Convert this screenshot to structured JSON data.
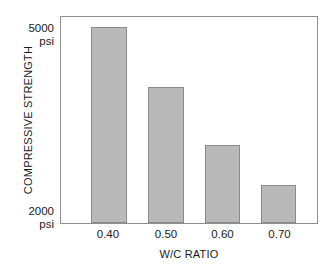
{
  "chart_data": {
    "type": "bar",
    "title": "",
    "xlabel": "W/C RATIO",
    "ylabel": "COMPRESSIVE STRENGTH",
    "categories": [
      "0.40",
      "0.50",
      "0.60",
      "0.70"
    ],
    "values": [
      5000,
      4100,
      3200,
      2600
    ],
    "value_unit": "psi",
    "ylim": [
      2000,
      5000
    ],
    "y_tick_labels": [
      "5000 psi",
      "2000 psi"
    ],
    "y_axis_top_value": "5000",
    "y_axis_top_unit": "psi",
    "y_axis_bottom_value": "2000",
    "y_axis_bottom_unit": "psi",
    "grid": false,
    "legend": false,
    "legend_position": "none",
    "bar_color": "#b9b9b9",
    "bar_edge_color": "#8a8a8a",
    "frame_color": "#8f8f8f",
    "background_color": "#ffffff",
    "bars": [
      {
        "category": "0.40",
        "value": 5000,
        "bar_left_pct": 11.6,
        "bar_width_pct": 14.0,
        "bar_height_pct": 95.2
      },
      {
        "category": "0.50",
        "value": 4100,
        "bar_left_pct": 34.1,
        "bar_width_pct": 14.0,
        "bar_height_pct": 65.9
      },
      {
        "category": "0.60",
        "value": 3200,
        "bar_left_pct": 56.2,
        "bar_width_pct": 13.6,
        "bar_height_pct": 38.0
      },
      {
        "category": "0.70",
        "value": 2600,
        "bar_left_pct": 78.3,
        "bar_width_pct": 13.6,
        "bar_height_pct": 18.3
      }
    ],
    "x_label_centers_pct": [
      18.6,
      41.1,
      63.0,
      85.1
    ]
  }
}
